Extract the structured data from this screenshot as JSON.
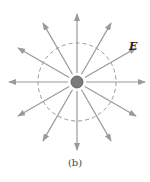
{
  "figure": {
    "field_label": "E",
    "caption": "(b)",
    "charge": {
      "cx": 77,
      "cy": 82,
      "r": 6,
      "fill": "#7a7a7a",
      "stroke": "#555555"
    },
    "dashed_circle": {
      "cx": 77,
      "cy": 82,
      "r": 39,
      "stroke": "#999999"
    },
    "field_lines": {
      "count": 12,
      "inner_radius": 9,
      "outer_radius": 68,
      "stroke": "#9a9a9a",
      "angles_deg": [
        0,
        30,
        60,
        90,
        120,
        150,
        180,
        210,
        240,
        270,
        300,
        330
      ]
    }
  }
}
